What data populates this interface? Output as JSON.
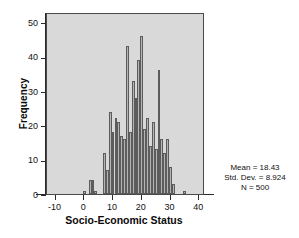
{
  "chart_data": {
    "type": "bar",
    "title": "",
    "subtitle": "",
    "xlabel": "Socio-Economic Status",
    "ylabel": "Frequency",
    "xlim": [
      -13,
      42
    ],
    "ylim": [
      0,
      53
    ],
    "xticks": [
      -10,
      0,
      10,
      20,
      30,
      40
    ],
    "xtick_labels": [
      "-10",
      "0",
      "10",
      "20",
      "30",
      "40"
    ],
    "yticks": [
      0,
      10,
      20,
      30,
      40,
      50
    ],
    "ytick_labels": [
      "0",
      "10",
      "20",
      "30",
      "40",
      "50"
    ],
    "grid": false,
    "legend": null,
    "bin_width": 1,
    "bar_fill": "#b4b4b4",
    "bar_edge": "#5c5c5c",
    "plot_background": "#d9d9d9",
    "categories": [
      0,
      1,
      2,
      3,
      4,
      5,
      6,
      7,
      8,
      9,
      10,
      11,
      12,
      13,
      14,
      15,
      16,
      17,
      18,
      19,
      20,
      21,
      22,
      23,
      24,
      25,
      26,
      27,
      28,
      29,
      30,
      31,
      32,
      33,
      35
    ],
    "values": [
      1,
      0,
      4,
      4,
      1,
      0,
      0,
      12,
      7,
      24,
      18,
      22,
      21,
      17,
      16,
      43,
      18,
      33,
      28,
      39,
      46,
      19,
      22,
      14,
      21,
      13,
      36,
      16,
      12,
      16,
      8,
      3,
      0,
      0,
      1
    ],
    "annotations": [
      "Mean = 18.43",
      "Std. Dev. = 8.924",
      "N = 500"
    ]
  },
  "stats": {
    "mean": "Mean = 18.43",
    "std_dev": "Std. Dev. = 8.924",
    "n": "N = 500"
  }
}
